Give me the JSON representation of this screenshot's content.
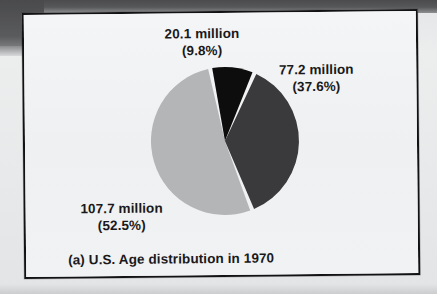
{
  "figure": {
    "caption": "(a) U.S. Age distribution in 1970"
  },
  "labels": {
    "black_slice": {
      "value": "20.1 million",
      "percent": "(9.8%)"
    },
    "dark_gray_slice": {
      "value": "77.2 million",
      "percent": "(37.6%)"
    },
    "light_gray_slice": {
      "value": "107.7 million",
      "percent": "(52.5%)"
    }
  },
  "colors": {
    "black": "#0d0d0d",
    "dark_gray": "#3a3a3c",
    "light_gray": "#b4b5b7",
    "frame_border": "#121214",
    "figure_background": "#f2f3f4",
    "page_background": "#e9eaec",
    "text": "#19191b",
    "slice_separator": "#f4f5f6"
  },
  "chart_data": {
    "type": "pie",
    "title": "(a) U.S. Age distribution in 1970",
    "subtitle": "",
    "xlabel": "",
    "ylabel": "",
    "unit": "million",
    "total": 205.0,
    "legend_position": "none",
    "grid": false,
    "labels": [
      "20.1 million",
      "77.2 million",
      "107.7 million"
    ],
    "values": [
      20.1,
      77.2,
      107.7
    ],
    "percents": [
      9.8,
      37.6,
      52.5
    ],
    "colors": [
      "#0d0d0d",
      "#3a3a3c",
      "#b4b5b7"
    ],
    "slices": [
      {
        "label": "20.1 million",
        "value": 20.1,
        "percent": 9.8,
        "color": "#0d0d0d",
        "start_angle_deg": -11,
        "end_angle_deg": 24,
        "label_position": "top"
      },
      {
        "label": "77.2 million",
        "value": 77.2,
        "percent": 37.6,
        "color": "#3a3a3c",
        "start_angle_deg": 24,
        "end_angle_deg": 159,
        "label_position": "right"
      },
      {
        "label": "107.7 million",
        "value": 107.7,
        "percent": 52.5,
        "color": "#b4b5b7",
        "start_angle_deg": 159,
        "end_angle_deg": 349,
        "label_position": "bottom-left"
      }
    ]
  }
}
